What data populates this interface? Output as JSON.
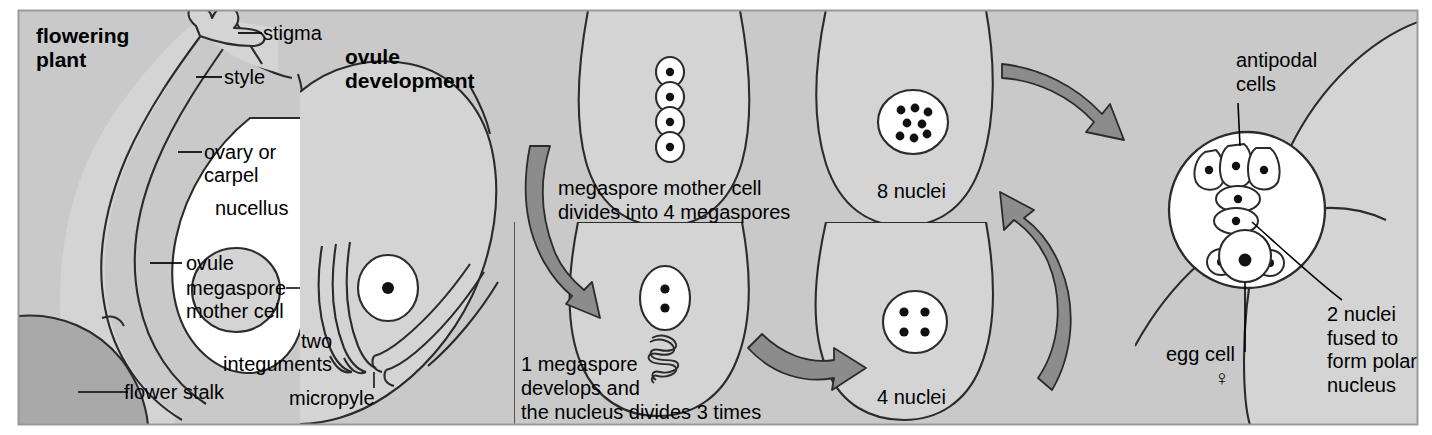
{
  "figure": {
    "title_panels": {
      "flowering_plant": "flowering\nplant",
      "ovule_development": "ovule\ndevelopment"
    },
    "colors": {
      "panel_background": "#c9c9c9",
      "tissue_light": "#d4d4d4",
      "tissue_lighter": "#dedede",
      "cell_white": "#ffffff",
      "flower_stalk": "#a9a9a9",
      "arrow_fill": "#8c8c8c",
      "outline": "#2b2b2b",
      "text": "#000000",
      "frame": "#9a9a9a"
    }
  },
  "panel1": {
    "name": "flowering plant",
    "heading_line1": "flowering",
    "heading_line2": "plant",
    "labels": {
      "stigma": "stigma",
      "style": "style",
      "ovary_line1": "ovary or",
      "ovary_line2": "carpel",
      "nucellus": "nucellus",
      "ovule": "ovule",
      "megaspore_line1": "megaspore",
      "megaspore_line2": "mother cell",
      "two": "two",
      "integuments": "integuments",
      "flower_stalk": "flower stalk"
    }
  },
  "panel2": {
    "name": "ovule development",
    "heading_line1": "ovule",
    "heading_line2": "development",
    "labels": {
      "micropyle": "micropyle"
    },
    "nuclei_count": 1
  },
  "panel3": {
    "name": "megaspore mother cell divides",
    "caption_line1": "megaspore mother cell",
    "caption_line2": "divides into 4 megaspores",
    "megaspore_count": 4
  },
  "panel4": {
    "name": "one megaspore develops",
    "caption_line1": "1 megaspore",
    "caption_line2": "develops and",
    "caption_line3": "the nucleus divides 3 times",
    "nuclei_count": 2
  },
  "panel5": {
    "name": "eight nuclei stage",
    "caption": "8 nuclei",
    "nuclei_count": 8
  },
  "panel6": {
    "name": "four nuclei stage",
    "caption": "4 nuclei",
    "nuclei_count": 4
  },
  "panel7": {
    "name": "mature embryo sac",
    "labels": {
      "antipodal_line1": "antipodal",
      "antipodal_line2": "cells",
      "egg_cell": "egg cell",
      "female_symbol": "♀",
      "polar_line1": "2 nuclei",
      "polar_line2": "fused to",
      "polar_line3": "form polar",
      "polar_line4": "nucleus"
    },
    "antipodal_cell_count": 3,
    "polar_nuclei_count": 2,
    "synergid_count": 2
  },
  "arrows": [
    {
      "id": "arrow-mmc-to-megaspores",
      "direction": "down-right"
    },
    {
      "id": "arrow-megaspore-to-4nuclei",
      "direction": "right"
    },
    {
      "id": "arrow-4nuclei-to-8nuclei",
      "direction": "up-right"
    },
    {
      "id": "arrow-8nuclei-to-embryosac",
      "direction": "right"
    }
  ]
}
